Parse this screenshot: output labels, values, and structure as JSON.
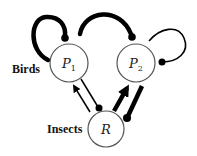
{
  "diagram": {
    "type": "food-web-interaction-diagram",
    "nodes": [
      {
        "id": "P1",
        "label": "P",
        "subscript": "1",
        "group": "Birds"
      },
      {
        "id": "P2",
        "label": "P",
        "subscript": "2",
        "group": "Birds"
      },
      {
        "id": "R",
        "label": "R",
        "subscript": "",
        "group": "Insects"
      }
    ],
    "group_labels": {
      "birds": "Birds",
      "insects": "Insects"
    },
    "edges": [
      {
        "from": "P1",
        "to": "P1",
        "style": "thick",
        "head": "dot",
        "kind": "self-limitation"
      },
      {
        "from": "P2",
        "to": "P2",
        "style": "thin",
        "head": "dot",
        "kind": "self-limitation"
      },
      {
        "from": "P1",
        "to": "P2",
        "style": "thick",
        "head": "dot",
        "kind": "competition"
      },
      {
        "from": "R",
        "to": "P1",
        "style": "thin",
        "head": "arrow",
        "kind": "positive"
      },
      {
        "from": "P1",
        "to": "R",
        "style": "thin",
        "head": "dot",
        "kind": "negative"
      },
      {
        "from": "R",
        "to": "P2",
        "style": "thick",
        "head": "arrow",
        "kind": "positive"
      },
      {
        "from": "P2",
        "to": "R",
        "style": "thick",
        "head": "dot",
        "kind": "negative"
      }
    ],
    "colors": {
      "stroke": "#000000",
      "node_stroke": "#555555",
      "background": "#ffffff"
    }
  }
}
